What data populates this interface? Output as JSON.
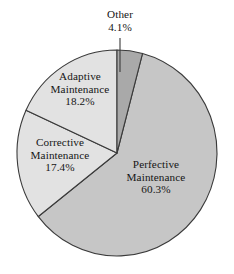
{
  "chart_data": {
    "type": "pie",
    "title": "",
    "subtitle": "",
    "xlabel": "",
    "ylabel": "",
    "legend_position": "none",
    "grid": false,
    "labels_inline": true,
    "units": "percent",
    "categories": [
      "Perfective Maintenance",
      "Adaptive Maintenance",
      "Corrective Maintenance",
      "Other"
    ],
    "values": [
      60.3,
      18.2,
      17.4,
      4.1
    ],
    "slices": [
      {
        "name": "Perfective Maintenance",
        "label_line1": "Perfective",
        "label_line2": "Maintenance",
        "percent_text": "60.3%",
        "value": 60.3,
        "color": "#c6c6c6",
        "start_angle_deg": 14.8,
        "sweep_deg": 217.1,
        "has_leader_line": false
      },
      {
        "name": "Corrective Maintenance",
        "label_line1": "Corrective",
        "label_line2": "Maintenance",
        "percent_text": "17.4%",
        "value": 17.4,
        "color": "#e2e2e2",
        "start_angle_deg": 231.9,
        "sweep_deg": 62.6,
        "has_leader_line": false
      },
      {
        "name": "Adaptive Maintenance",
        "label_line1": "Adaptive",
        "label_line2": "Maintenance",
        "percent_text": "18.2%",
        "value": 18.2,
        "color": "#e2e2e2",
        "start_angle_deg": 294.5,
        "sweep_deg": 65.5,
        "has_leader_line": false
      },
      {
        "name": "Other",
        "label_line1": "Other",
        "label_line2": "",
        "percent_text": "4.1%",
        "value": 4.1,
        "color": "#a9a9a9",
        "start_angle_deg": 0.0,
        "sweep_deg": 14.8,
        "has_leader_line": true
      }
    ],
    "total_percent": 100.0,
    "colors": {
      "perfective": "#c6c6c6",
      "adaptive": "#e2e2e2",
      "corrective": "#e2e2e2",
      "other": "#a9a9a9",
      "outline": "#3a3a3a",
      "text": "#151515",
      "background": "#ffffff"
    },
    "geometry": {
      "center_x": 117,
      "center_y": 153,
      "radius_x": 100,
      "radius_y": 103,
      "leader_line_x": 120,
      "leader_line_top_y": 38,
      "leader_line_bottom_y": 72
    }
  }
}
